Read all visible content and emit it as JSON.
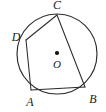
{
  "figure": {
    "kind": "geometry-diagram",
    "background_color": "#ffffff",
    "stroke_color": "#2b2b2b",
    "label_color": "#1a1a1a",
    "canvas": {
      "width": 106,
      "height": 112
    }
  },
  "circle": {
    "name": "circumscribed-circle",
    "center": {
      "x": 57,
      "y": 54
    },
    "radius": 40,
    "stroke_width": 1.15
  },
  "center_point": {
    "label": "O",
    "marker": "filled-dot",
    "dot": {
      "x": 57,
      "y": 53,
      "r": 2.1
    },
    "label_pos": {
      "x": 57,
      "y": 65
    }
  },
  "vertices": [
    {
      "id": "C",
      "label": "C",
      "x": 57,
      "y": 15,
      "label_pos": {
        "x": 57,
        "y": 6
      }
    },
    {
      "id": "D",
      "label": "D",
      "x": 26,
      "y": 40,
      "label_pos": {
        "x": 16,
        "y": 38
      }
    },
    {
      "id": "A",
      "label": "A",
      "x": 31,
      "y": 90,
      "label_pos": {
        "x": 30,
        "y": 103
      }
    },
    {
      "id": "B",
      "label": "B",
      "x": 85,
      "y": 87,
      "label_pos": {
        "x": 93,
        "y": 100
      }
    }
  ],
  "edges": [
    {
      "id": "CD",
      "from": "C",
      "to": "D"
    },
    {
      "id": "DA",
      "from": "D",
      "to": "A"
    },
    {
      "id": "AB",
      "from": "A",
      "to": "B"
    },
    {
      "id": "BC",
      "from": "B",
      "to": "C"
    }
  ]
}
